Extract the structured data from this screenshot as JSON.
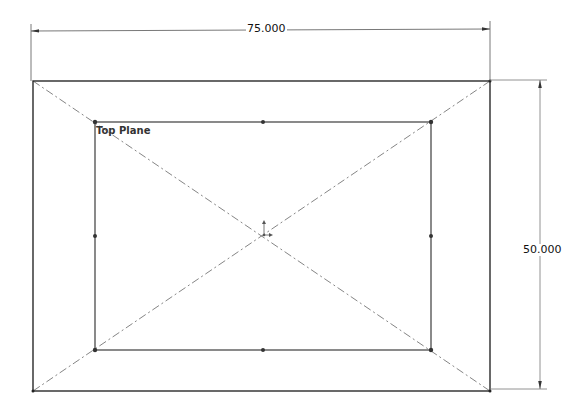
{
  "sketch": {
    "plane_label": "Top Plane",
    "dimensions": {
      "width": "75.000",
      "height": "50.000"
    },
    "outer_rect": {
      "x1": 33,
      "y1": 81,
      "x2": 490,
      "y2": 391
    },
    "inner_rect": {
      "x1": 95,
      "y1": 122,
      "x2": 431,
      "y2": 350
    },
    "origin": {
      "x": 264,
      "y": 235
    },
    "colors": {
      "geometry": "#2a2a2a",
      "construction": "#666666",
      "dimension": "#444444",
      "background": "#ffffff"
    }
  }
}
